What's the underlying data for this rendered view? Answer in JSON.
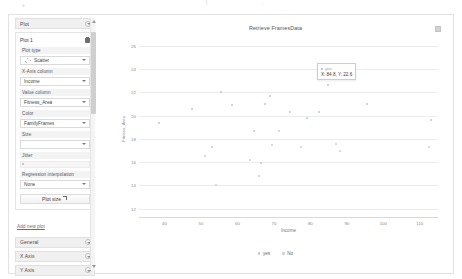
{
  "window": {
    "top_marks": [
      "+",
      "|",
      "·"
    ]
  },
  "sidebar": {
    "plot_section": {
      "header_label": "Plot",
      "collapse_icon": "chevron-down-icon",
      "card_title": "Plot 1",
      "delete_icon": "trash-icon",
      "fields": [
        {
          "label": "Plot type",
          "value": "Scatter",
          "icon": "scatter-icon"
        },
        {
          "label": "X-Axis column",
          "value": "Income",
          "icon": ""
        },
        {
          "label": "Value column",
          "value": "Fitness_Area",
          "icon": ""
        },
        {
          "label": "Color",
          "value": "FamilyFrames",
          "icon": ""
        },
        {
          "label": "Size",
          "value": "",
          "icon": ""
        }
      ],
      "jitter": {
        "label": "Jitter",
        "value": ""
      },
      "regression": {
        "label": "Regression interpolation",
        "value": "None"
      },
      "plot_size_button": {
        "label": "Plot size",
        "icon": "resize-icon"
      },
      "add_new_plot": "Add new plot"
    },
    "sections": [
      {
        "label": "General",
        "collapse_icon": "chevron-down-icon"
      },
      {
        "label": "X Axis",
        "collapse_icon": "chevron-down-icon"
      },
      {
        "label": "Y Axis",
        "collapse_icon": "chevron-down-icon"
      }
    ],
    "scrollbar": {
      "up_icon": "caret-up-icon",
      "down_icon": "caret-down-icon"
    }
  },
  "chart_panel": {
    "menu_icon": "chart-menu-icon"
  },
  "tooltip": {
    "series_label": "yes",
    "coords": "X: 84.8, Y: 22.6",
    "swatch_color": "#9fb7d4"
  },
  "colors": {
    "series_yes": "#b9c9dc",
    "series_no": "#cfcfcf",
    "gridline": "#ececec",
    "axis": "#d8d8d8"
  },
  "chart_data": {
    "type": "scatter",
    "title": "Retrieve FramesData",
    "xlabel": "Income",
    "ylabel": "Fitness_Area",
    "xlim": [
      33,
      115
    ],
    "ylim": [
      11.2,
      26.6
    ],
    "xticks": [
      40,
      50,
      60,
      70,
      80,
      90,
      100,
      110
    ],
    "yticks": [
      26,
      24,
      22,
      20,
      18,
      16,
      14,
      12
    ],
    "grid": true,
    "legend_position": "bottom",
    "series": [
      {
        "name": "yes",
        "color": "#b9c9dc",
        "points": [
          {
            "x": 38.5,
            "y": 19.4
          },
          {
            "x": 47.5,
            "y": 20.6
          },
          {
            "x": 53.0,
            "y": 17.3
          },
          {
            "x": 55.5,
            "y": 22.0
          },
          {
            "x": 58.5,
            "y": 20.9
          },
          {
            "x": 64.5,
            "y": 18.7
          },
          {
            "x": 66.5,
            "y": 15.9
          },
          {
            "x": 67.5,
            "y": 21.0
          },
          {
            "x": 69.0,
            "y": 21.7
          },
          {
            "x": 74.5,
            "y": 20.3
          },
          {
            "x": 79.0,
            "y": 19.8
          },
          {
            "x": 82.5,
            "y": 20.3
          },
          {
            "x": 84.8,
            "y": 22.6
          },
          {
            "x": 95.5,
            "y": 21.0
          },
          {
            "x": 113.0,
            "y": 19.6
          }
        ]
      },
      {
        "name": "No",
        "color": "#cfcfcf",
        "points": [
          {
            "x": 51.0,
            "y": 16.5
          },
          {
            "x": 54.0,
            "y": 14.0
          },
          {
            "x": 63.5,
            "y": 16.2
          },
          {
            "x": 66.0,
            "y": 14.8
          },
          {
            "x": 69.5,
            "y": 17.5
          },
          {
            "x": 71.5,
            "y": 18.7
          },
          {
            "x": 77.5,
            "y": 17.3
          },
          {
            "x": 87.0,
            "y": 17.6
          },
          {
            "x": 88.0,
            "y": 17.0
          },
          {
            "x": 112.5,
            "y": 17.3
          }
        ]
      }
    ]
  }
}
